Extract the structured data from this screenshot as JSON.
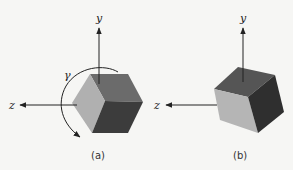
{
  "figure": {
    "panel_a": {
      "caption": "(a)",
      "axis_y_label": "y",
      "axis_z_label": "z",
      "rotation_label": "γ",
      "faces": {
        "top": "#6b6b6b",
        "left": "#b0b0b0",
        "right": "#3c3c3c"
      }
    },
    "panel_b": {
      "caption": "(b)",
      "axis_y_label": "y",
      "axis_z_label": "z",
      "faces": {
        "top": "#555555",
        "front": "#b5b5b5",
        "right": "#2f2f2f"
      }
    },
    "colors": {
      "background": "#f6f6f4",
      "axis": "#222222"
    }
  }
}
